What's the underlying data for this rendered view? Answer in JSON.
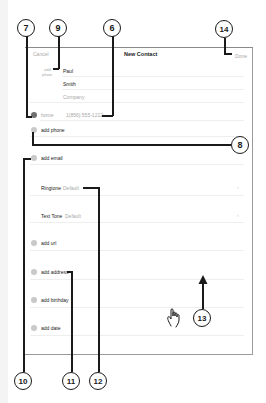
{
  "header": {
    "cancel_label": "Cancel",
    "title": "New Contact",
    "done_label": "Done"
  },
  "photo": {
    "label_line1": "add",
    "label_line2": "photo"
  },
  "name_fields": {
    "first": "Paul",
    "last": "Smith",
    "company_placeholder": "Company"
  },
  "phone": {
    "label": "home",
    "value": "1(856) 555-1212",
    "add_label": "add phone"
  },
  "email": {
    "add_label": "add email"
  },
  "ringtone": {
    "label": "Ringtone",
    "value": "Default"
  },
  "texttone": {
    "label": "Text Tone",
    "value": "Default"
  },
  "fields": {
    "add_url": "add url",
    "add_address": "add address",
    "add_birthday": "add birthday",
    "add_date": "add date"
  },
  "callouts": {
    "c6": "6",
    "c7": "7",
    "c8": "8",
    "c9": "9",
    "c10": "10",
    "c11": "11",
    "c12": "12",
    "c13": "13",
    "c14": "14"
  }
}
